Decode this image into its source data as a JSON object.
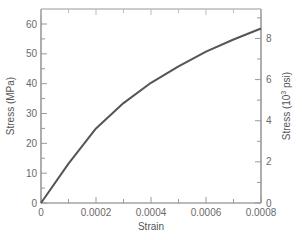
{
  "chart_data": {
    "type": "line",
    "title": "",
    "xlabel": "Strain",
    "ylabel": "Stress (MPa)",
    "ylabel_right": "Stress (10^3 psi)",
    "xlim": [
      0,
      0.0008
    ],
    "ylim": [
      0,
      65
    ],
    "ylim_right": [
      0,
      9.43
    ],
    "grid": false,
    "legend": "none",
    "x_ticks": [
      "0",
      "0.0002",
      "0.0004",
      "0.0006",
      "0.0008"
    ],
    "y_ticks": [
      "0",
      "10",
      "20",
      "30",
      "40",
      "50",
      "60"
    ],
    "y_ticks_right": [
      "0",
      "2",
      "4",
      "6",
      "8"
    ],
    "series": [
      {
        "name": "Stress-strain curve",
        "color": "#555555",
        "x": [
          0,
          0.0001,
          0.0002,
          0.0003,
          0.0004,
          0.0005,
          0.0006,
          0.0007,
          0.0008
        ],
        "y": [
          0,
          13.2,
          25,
          33.5,
          40.3,
          45.8,
          50.7,
          54.8,
          58.5
        ]
      }
    ]
  },
  "labels": {
    "xlabel": "Strain",
    "ylabel_left": "Stress (MPa)",
    "ylabel_right_pre": "Stress (10",
    "ylabel_right_sup": "3",
    "ylabel_right_post": " psi)"
  }
}
